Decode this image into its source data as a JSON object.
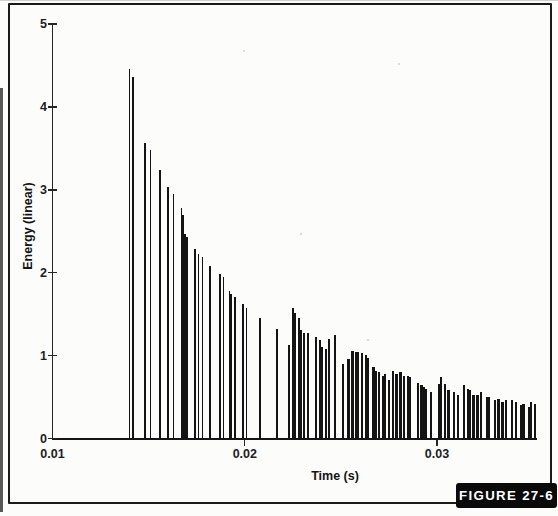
{
  "figure": {
    "label": "FIGURE 27-6",
    "badge_background": "#0a0a0a",
    "badge_text_color": "#ffffff",
    "frame_color": "#1a1a1a",
    "paper_color": "#fcfcfa"
  },
  "chart_data": {
    "type": "bar",
    "subtype": "stem-impulse-plot",
    "title": "",
    "xlabel": "Time (s)",
    "ylabel": "Energy (linear)",
    "xlim": [
      0.01,
      0.0352
    ],
    "ylim": [
      0,
      5
    ],
    "x_ticks": [
      0.01,
      0.02,
      0.03
    ],
    "x_tick_labels": [
      "0.01",
      "0.02",
      "0.03"
    ],
    "y_ticks": [
      0,
      1,
      2,
      3,
      4,
      5
    ],
    "y_tick_labels": [
      "0",
      "1",
      "2",
      "3",
      "4",
      "5"
    ],
    "grid": false,
    "legend": false,
    "bar_color": "#141414",
    "axis_color": "#262626",
    "points": [
      [
        0.014,
        4.46
      ],
      [
        0.0142,
        4.36
      ],
      [
        0.0148,
        3.56
      ],
      [
        0.0151,
        3.48
      ],
      [
        0.0156,
        3.24
      ],
      [
        0.016,
        3.03
      ],
      [
        0.0163,
        2.95
      ],
      [
        0.0167,
        2.78
      ],
      [
        0.0168,
        2.7
      ],
      [
        0.0169,
        2.47
      ],
      [
        0.017,
        2.43
      ],
      [
        0.0174,
        2.29
      ],
      [
        0.0176,
        2.23
      ],
      [
        0.0178,
        2.19
      ],
      [
        0.0182,
        2.08
      ],
      [
        0.0187,
        1.99
      ],
      [
        0.0189,
        1.95
      ],
      [
        0.0192,
        1.78
      ],
      [
        0.0193,
        1.74
      ],
      [
        0.0195,
        1.71
      ],
      [
        0.0199,
        1.62
      ],
      [
        0.0201,
        1.58
      ],
      [
        0.0208,
        1.45
      ],
      [
        0.0217,
        1.32
      ],
      [
        0.0223,
        1.13
      ],
      [
        0.0225,
        1.57
      ],
      [
        0.0226,
        1.51
      ],
      [
        0.0228,
        1.46
      ],
      [
        0.0229,
        1.31
      ],
      [
        0.0231,
        1.27
      ],
      [
        0.0233,
        1.27
      ],
      [
        0.0237,
        1.23
      ],
      [
        0.0239,
        1.19
      ],
      [
        0.024,
        1.11
      ],
      [
        0.0242,
        1.08
      ],
      [
        0.0244,
        1.2
      ],
      [
        0.0247,
        1.25
      ],
      [
        0.0251,
        0.9
      ],
      [
        0.0254,
        0.96
      ],
      [
        0.0256,
        1.06
      ],
      [
        0.0258,
        1.05
      ],
      [
        0.0259,
        1.04
      ],
      [
        0.0261,
        1.03
      ],
      [
        0.0263,
        1.01
      ],
      [
        0.0264,
        0.97
      ],
      [
        0.0267,
        0.86
      ],
      [
        0.0268,
        0.82
      ],
      [
        0.027,
        0.8
      ],
      [
        0.0272,
        0.76
      ],
      [
        0.0273,
        0.78
      ],
      [
        0.0275,
        0.71
      ],
      [
        0.0277,
        0.82
      ],
      [
        0.0279,
        0.78
      ],
      [
        0.0281,
        0.8
      ],
      [
        0.0283,
        0.76
      ],
      [
        0.0285,
        0.76
      ],
      [
        0.0286,
        0.74
      ],
      [
        0.029,
        0.67
      ],
      [
        0.0292,
        0.64
      ],
      [
        0.0293,
        0.62
      ],
      [
        0.0294,
        0.6
      ],
      [
        0.0297,
        0.56
      ],
      [
        0.0301,
        0.66
      ],
      [
        0.0302,
        0.74
      ],
      [
        0.0304,
        0.66
      ],
      [
        0.0306,
        0.58
      ],
      [
        0.0309,
        0.56
      ],
      [
        0.0311,
        0.52
      ],
      [
        0.0314,
        0.65
      ],
      [
        0.0316,
        0.6
      ],
      [
        0.0317,
        0.58
      ],
      [
        0.0319,
        0.52
      ],
      [
        0.0321,
        0.52
      ],
      [
        0.0323,
        0.56
      ],
      [
        0.0326,
        0.5
      ],
      [
        0.0327,
        0.5
      ],
      [
        0.033,
        0.46
      ],
      [
        0.0332,
        0.48
      ],
      [
        0.0334,
        0.44
      ],
      [
        0.0336,
        0.46
      ],
      [
        0.0339,
        0.46
      ],
      [
        0.0341,
        0.44
      ],
      [
        0.0344,
        0.4
      ],
      [
        0.0345,
        0.42
      ],
      [
        0.0348,
        0.38
      ],
      [
        0.0349,
        0.44
      ],
      [
        0.0351,
        0.42
      ]
    ]
  }
}
